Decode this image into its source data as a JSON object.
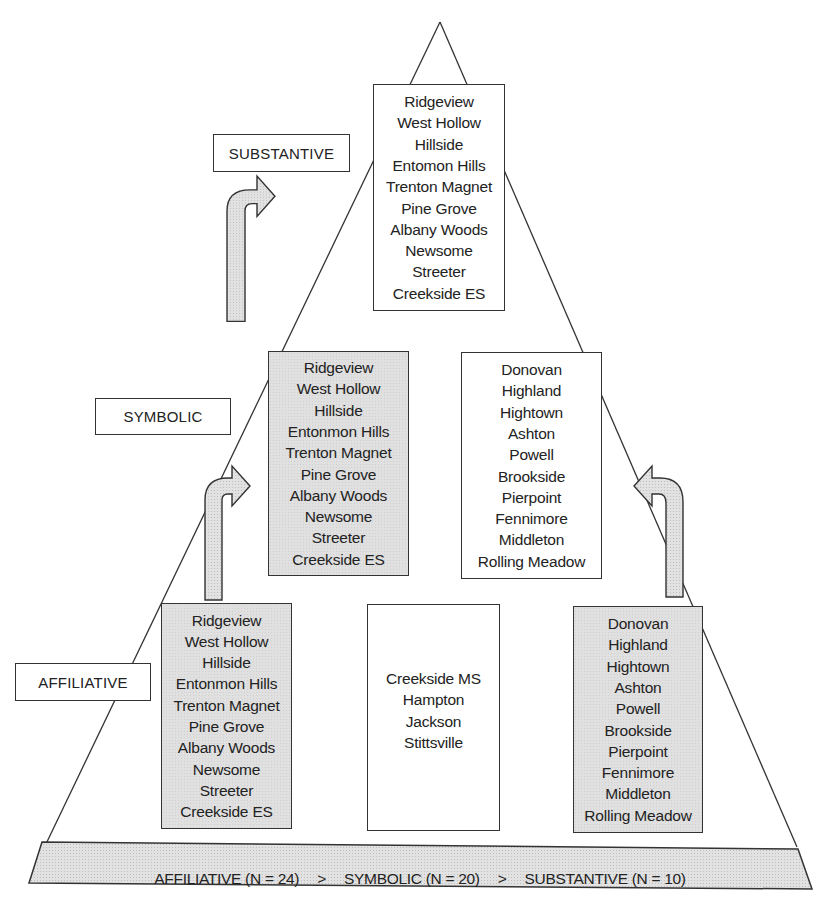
{
  "levels": {
    "substantive": {
      "label": "SUBSTANTIVE",
      "box": {
        "shading": "white",
        "items": [
          "Ridgeview",
          "West Hollow",
          "Hillside",
          "Entomon Hills",
          "Trenton Magnet",
          "Pine Grove",
          "Albany Woods",
          "Newsome",
          "Streeter",
          "Creekside ES"
        ]
      }
    },
    "symbolic": {
      "label": "SYMBOLIC",
      "left_box": {
        "shading": "gray",
        "items": [
          "Ridgeview",
          "West Hollow",
          "Hillside",
          "Entonmon Hills",
          "Trenton Magnet",
          "Pine Grove",
          "Albany Woods",
          "Newsome",
          "Streeter",
          "Creekside ES"
        ]
      },
      "right_box": {
        "shading": "white",
        "items": [
          "Donovan",
          "Highland",
          "Hightown",
          "Ashton",
          "Powell",
          "Brookside",
          "Pierpoint",
          "Fennimore",
          "Middleton",
          "Rolling Meadow"
        ]
      }
    },
    "affiliative": {
      "label": "AFFILIATIVE",
      "left_box": {
        "shading": "gray",
        "items": [
          "Ridgeview",
          "West Hollow",
          "Hillside",
          "Entonmon Hills",
          "Trenton Magnet",
          "Pine Grove",
          "Albany Woods",
          "Newsome",
          "Streeter",
          "Creekside ES"
        ]
      },
      "center_box": {
        "shading": "white",
        "items": [
          "Creekside MS",
          "Hampton",
          "Jackson",
          "Stittsville"
        ]
      },
      "right_box": {
        "shading": "gray",
        "items": [
          "Donovan",
          "Highland",
          "Hightown",
          "Ashton",
          "Powell",
          "Brookside",
          "Pierpoint",
          "Fennimore",
          "Middleton",
          "Rolling Meadow"
        ]
      }
    }
  },
  "arrows": [
    {
      "from": "affiliative.left_box",
      "to": "symbolic.left_box",
      "direction": "up-right"
    },
    {
      "from": "symbolic.left_box",
      "to": "substantive.box",
      "direction": "up-right"
    },
    {
      "from": "affiliative.right_box",
      "to": "symbolic.right_box",
      "direction": "up-left"
    }
  ],
  "summary": {
    "affiliative": "AFFILIATIVE (N = 24)",
    "symbolic": "SYMBOLIC (N = 20)",
    "substantive": "SUBSTANTIVE (N = 10)",
    "separator": ">"
  },
  "colors": {
    "line": "#333333",
    "gray_fill": "#e0e0e0",
    "white_fill": "#ffffff"
  }
}
